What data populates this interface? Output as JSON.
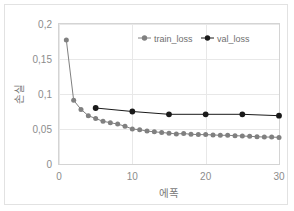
{
  "chart_data": {
    "type": "line",
    "title": "",
    "xlabel": "에폭",
    "ylabel": "손실",
    "xlim": [
      0,
      30
    ],
    "ylim": [
      0,
      0.2
    ],
    "grid": true,
    "legend_position": "top-center",
    "x_ticks": [
      "0",
      "10",
      "20",
      "30"
    ],
    "x_tick_values": [
      0,
      10,
      20,
      30
    ],
    "y_ticks": [
      "0",
      "0,05",
      "0,1",
      "0,15",
      "0,2"
    ],
    "y_tick_values": [
      0,
      0.05,
      0.1,
      0.15,
      0.2
    ],
    "series": [
      {
        "name": "train_loss",
        "color": "#808080",
        "marker": "circle",
        "x": [
          1,
          2,
          3,
          4,
          5,
          6,
          7,
          8,
          9,
          10,
          11,
          12,
          13,
          14,
          15,
          16,
          17,
          18,
          19,
          20,
          21,
          22,
          23,
          24,
          25,
          26,
          27,
          28,
          29,
          30
        ],
        "values": [
          0.177,
          0.091,
          0.078,
          0.069,
          0.065,
          0.061,
          0.059,
          0.057,
          0.054,
          0.05,
          0.049,
          0.047,
          0.046,
          0.045,
          0.044,
          0.043,
          0.0435,
          0.0425,
          0.042,
          0.042,
          0.0415,
          0.041,
          0.041,
          0.0405,
          0.04,
          0.0395,
          0.039,
          0.0385,
          0.0385,
          0.038
        ]
      },
      {
        "name": "val_loss",
        "color": "#1a1a1a",
        "marker": "circle",
        "x": [
          5,
          10,
          15,
          20,
          25,
          30
        ],
        "values": [
          0.08,
          0.075,
          0.071,
          0.071,
          0.071,
          0.069
        ]
      }
    ]
  },
  "legend": {
    "items": [
      {
        "label": "train_loss",
        "color": "#808080"
      },
      {
        "label": "val_loss",
        "color": "#1a1a1a"
      }
    ]
  },
  "axes": {
    "x_title": "에폭",
    "y_title": "손실"
  }
}
